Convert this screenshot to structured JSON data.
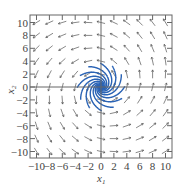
{
  "figure": {
    "type": "phase-portrait",
    "xlabel": "x1",
    "ylabel": "x2",
    "xlim": [
      -11,
      11
    ],
    "ylim": [
      -11,
      11
    ],
    "x_ticks": [
      "−10",
      "−8",
      "−6",
      "−4",
      "−2",
      "0",
      "2",
      "4",
      "6",
      "8",
      "10"
    ],
    "y_ticks": [
      "10",
      "8",
      "6",
      "4",
      "2",
      "0",
      "−2",
      "−4",
      "−6",
      "−8",
      "−10"
    ],
    "trajectory_color": "#2a63b5",
    "arrow_color": "#555555",
    "frame_color": "#666666"
  }
}
